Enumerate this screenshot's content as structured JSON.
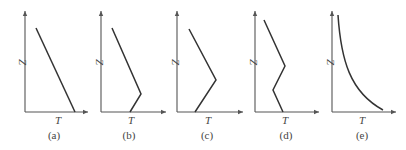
{
  "figure": {
    "panels": [
      {
        "id": "a",
        "caption": "(a)",
        "xlabel": "T",
        "ylabel": "Z"
      },
      {
        "id": "b",
        "caption": "(b)",
        "xlabel": "T",
        "ylabel": "Z"
      },
      {
        "id": "c",
        "caption": "(c)",
        "xlabel": "T",
        "ylabel": "Z"
      },
      {
        "id": "d",
        "caption": "(d)",
        "xlabel": "T",
        "ylabel": "Z"
      },
      {
        "id": "e",
        "caption": "(e)",
        "xlabel": "T",
        "ylabel": "Z"
      }
    ],
    "colors": {
      "axis": "#555555",
      "line": "#333333",
      "text": "#444444"
    }
  }
}
